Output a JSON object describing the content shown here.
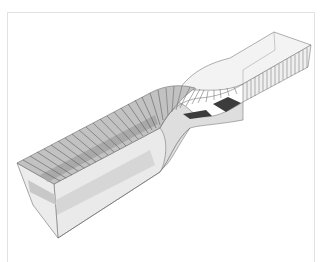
{
  "figure": {
    "colors": {
      "background": "#ffffff",
      "frame": "#e2e2e2",
      "edge": "#6e6e6e",
      "rib": "#5a5a5a",
      "top_face": "#bdbdbd",
      "top_band": "#a8a8a8",
      "side_face": "#e6e6e6",
      "side_band": "#d2d2d2",
      "end_face": "#ececec",
      "twist_face": "#cfcfcf",
      "dark_patch": "#3c3c3c"
    },
    "left_end": {
      "top_back": [
        17,
        163
      ],
      "top_front": [
        54,
        184
      ],
      "bottom_back": [
        33,
        205
      ],
      "bottom_front": [
        58,
        238
      ]
    },
    "right_end": {
      "top_back": [
        274,
        32
      ],
      "top_right": [
        311,
        45
      ],
      "inner_back": [
        275,
        50
      ],
      "bottom_right": [
        308,
        67
      ],
      "front_lower": [
        243,
        84
      ]
    },
    "dark_patches": [
      {
        "points": "213,104 228,97 241,103 226,112"
      },
      {
        "points": "183,114 206,110 212,116 190,119"
      }
    ],
    "rib_count_left": 20,
    "rib_count_right": 16
  }
}
